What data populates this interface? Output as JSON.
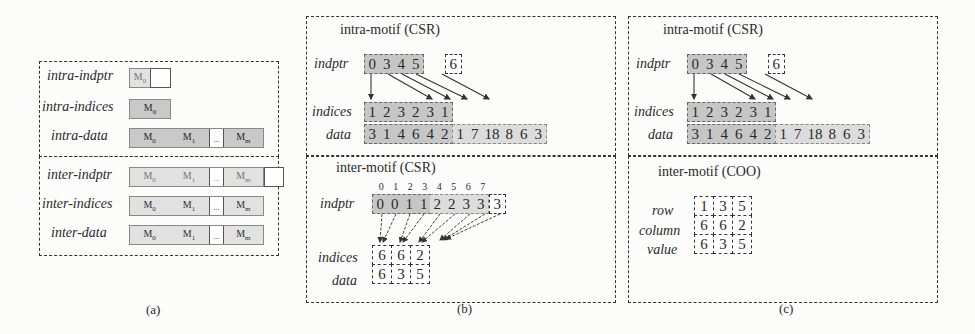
{
  "panel_a": {
    "caption": "(a)",
    "intra": [
      {
        "label": "intra-indptr",
        "segments": [
          "M0"
        ],
        "has_trailing_empty": true
      },
      {
        "label": "intra-indices",
        "segments": [
          "M0"
        ]
      },
      {
        "label": "intra-data",
        "segments": [
          "M0",
          "M1",
          "...",
          "Mm"
        ]
      }
    ],
    "inter": [
      {
        "label": "inter-indptr",
        "segments": [
          "M0",
          "M1",
          "...",
          "Mm"
        ],
        "has_trailing_empty": true
      },
      {
        "label": "inter-indices",
        "segments": [
          "M0",
          "M1",
          "...",
          "Mm"
        ]
      },
      {
        "label": "inter-data",
        "segments": [
          "M0",
          "M1",
          "...",
          "Mm"
        ]
      }
    ]
  },
  "panel_b": {
    "caption": "(b)",
    "intra": {
      "title": "intra-motif (CSR)",
      "indptr_label": "indptr",
      "indptr": [
        "0",
        "3",
        "4",
        "5"
      ],
      "indptr_last": "6",
      "indices_label": "indices",
      "indices": [
        "1",
        "2",
        "3",
        "2",
        "3",
        "1"
      ],
      "data_label": "data",
      "data_dark": [
        "3",
        "1",
        "4",
        "6",
        "4",
        "2"
      ],
      "data_light": [
        "1",
        "7",
        "18",
        "8",
        "6",
        "3"
      ]
    },
    "inter": {
      "title": "inter-motif (CSR)",
      "positions": [
        "0",
        "1",
        "2",
        "3",
        "4",
        "5",
        "6",
        "7"
      ],
      "indptr_label": "indptr",
      "indptr_dark": [
        "0",
        "0",
        "1",
        "1"
      ],
      "indptr_light": [
        "2",
        "2",
        "3",
        "3"
      ],
      "indptr_last": "3",
      "indices_label": "indices",
      "indices": [
        "6",
        "6",
        "2"
      ],
      "data_label": "data",
      "data": [
        "6",
        "3",
        "5"
      ]
    }
  },
  "panel_c": {
    "caption": "(c)",
    "intra": {
      "title": "intra-motif (CSR)",
      "indptr_label": "indptr",
      "indptr": [
        "0",
        "3",
        "4",
        "5"
      ],
      "indptr_last": "6",
      "indices_label": "indices",
      "indices": [
        "1",
        "2",
        "3",
        "2",
        "3",
        "1"
      ],
      "data_label": "data",
      "data_dark": [
        "3",
        "1",
        "4",
        "6",
        "4",
        "2"
      ],
      "data_light": [
        "1",
        "7",
        "18",
        "8",
        "6",
        "3"
      ]
    },
    "inter": {
      "title": "inter-motif (COO)",
      "row_label": "row",
      "row": [
        "1",
        "3",
        "5"
      ],
      "column_label": "column",
      "column": [
        "6",
        "6",
        "2"
      ],
      "value_label": "value",
      "value": [
        "6",
        "3",
        "5"
      ]
    }
  }
}
